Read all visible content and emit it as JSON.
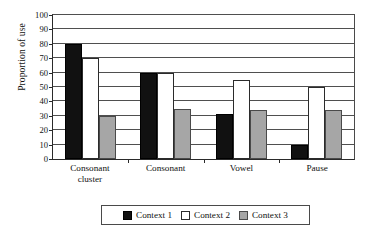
{
  "chart_data": {
    "type": "bar",
    "title": "",
    "xlabel": "",
    "ylabel": "Proportion of use",
    "ylim": [
      0,
      100
    ],
    "ytick_step": 10,
    "yticks": [
      0,
      10,
      20,
      30,
      40,
      50,
      60,
      70,
      80,
      90,
      100
    ],
    "grid": true,
    "legend_position": "bottom",
    "categories": [
      "Consonant cluster",
      "Consonant",
      "Vowel",
      "Pause"
    ],
    "category_lines": [
      [
        "Consonant",
        "cluster"
      ],
      [
        "Consonant"
      ],
      [
        "Vowel"
      ],
      [
        "Pause"
      ]
    ],
    "series": [
      {
        "name": "Context 1",
        "color": "#111111",
        "values": [
          80,
          60,
          31,
          10
        ]
      },
      {
        "name": "Context 2",
        "color": "#ffffff",
        "values": [
          70,
          60,
          55,
          50
        ]
      },
      {
        "name": "Context 3",
        "color": "#a6a6a6",
        "values": [
          30,
          35,
          34,
          34
        ]
      }
    ]
  }
}
